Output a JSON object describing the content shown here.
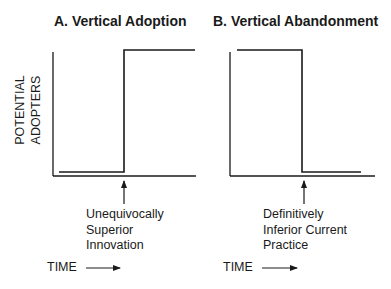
{
  "panels": [
    {
      "title": "A. Vertical Adoption",
      "ylabel_line1": "POTENTIAL",
      "ylabel_line2": "ADOPTERS",
      "annotation_lines": [
        "Unequivocally",
        "Superior",
        "Innovation"
      ],
      "xlabel": "TIME"
    },
    {
      "title": "B. Vertical Abandonment",
      "annotation_lines": [
        "Definitively",
        "Inferior Current",
        "Practice"
      ],
      "xlabel": "TIME"
    }
  ],
  "colors": {
    "line": "#1a1a1a",
    "background": "#ffffff"
  }
}
